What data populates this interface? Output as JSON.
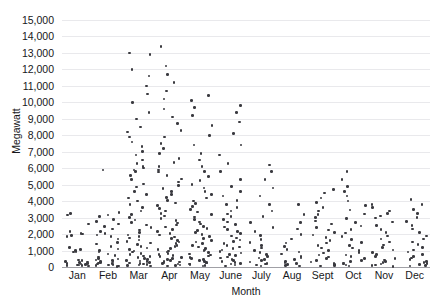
{
  "chart_data": {
    "type": "scatter",
    "title": "",
    "subtitle": "",
    "xlabel": "Month",
    "ylabel": "Megawatt",
    "categories": [
      "Jan",
      "Feb",
      "Mar",
      "Apr",
      "May",
      "June",
      "July",
      "Aug",
      "Sept",
      "Oct",
      "Nov",
      "Dec"
    ],
    "ylim": [
      0,
      15000
    ],
    "ytick_step": 1000,
    "ytick_labels": [
      "0",
      "1,000",
      "2,000",
      "3,000",
      "4,000",
      "5,000",
      "6,000",
      "7,000",
      "8,000",
      "9,000",
      "10,000",
      "11,000",
      "12,000",
      "13,000",
      "14,000",
      "15,000"
    ],
    "ytick_values": [
      0,
      1000,
      2000,
      3000,
      4000,
      5000,
      6000,
      7000,
      8000,
      9000,
      10000,
      11000,
      12000,
      13000,
      14000,
      15000
    ],
    "grid": "horizontal",
    "legend": "none",
    "marker": "dot",
    "marker_color": "#3a3a3f",
    "gridline_color": "#e9e9ec",
    "axis_color": "#a0a0a6",
    "jitter": true,
    "series": [
      {
        "name": "Megawatt",
        "points_by_month": {
          "Jan": [
            60,
            80,
            90,
            110,
            130,
            150,
            170,
            200,
            230,
            260,
            300,
            340,
            380,
            430,
            900,
            950,
            1000,
            1050,
            1200,
            1850,
            1900,
            2000,
            2050,
            2150,
            2600,
            3150,
            3250
          ],
          "Feb": [
            40,
            70,
            100,
            130,
            160,
            190,
            220,
            250,
            280,
            310,
            350,
            390,
            430,
            480,
            520,
            600,
            700,
            800,
            900,
            1000,
            1100,
            1250,
            1400,
            1500,
            1700,
            1850,
            1950,
            2050,
            2150,
            2300,
            2450,
            2600,
            2750,
            2900,
            3050,
            3150,
            3300,
            5900
          ],
          "Mar": [
            50,
            80,
            110,
            140,
            170,
            200,
            240,
            280,
            320,
            360,
            400,
            450,
            500,
            560,
            620,
            680,
            750,
            820,
            900,
            980,
            1050,
            1150,
            1250,
            1350,
            1450,
            1550,
            1650,
            1750,
            1850,
            1950,
            2100,
            2250,
            2400,
            2550,
            2700,
            2850,
            3000,
            3200,
            3400,
            3600,
            3800,
            4000,
            4200,
            4400,
            4600,
            4850,
            5050,
            5300,
            5550,
            5800,
            5900,
            6000,
            6100,
            6300,
            6500,
            6800,
            7000,
            7300,
            7600,
            7900,
            8200,
            8500,
            9000,
            9400,
            10000,
            10500,
            11000,
            11600,
            12000,
            12900,
            13000
          ],
          "Apr": [
            50,
            90,
            130,
            170,
            210,
            250,
            300,
            350,
            400,
            450,
            500,
            560,
            620,
            690,
            760,
            830,
            900,
            980,
            1060,
            1140,
            1230,
            1320,
            1420,
            1520,
            1620,
            1720,
            1830,
            1940,
            2050,
            2170,
            2290,
            2420,
            2550,
            2680,
            2820,
            2960,
            3100,
            3250,
            3400,
            3560,
            3720,
            3880,
            4050,
            4220,
            4400,
            4580,
            4760,
            4950,
            5150,
            5350,
            5550,
            5760,
            5900,
            6100,
            6350,
            6600,
            6900,
            7200,
            7500,
            7900,
            8300,
            8700,
            9100,
            9600,
            10200,
            10700,
            11200,
            11700,
            12200,
            13400
          ],
          "May": [
            60,
            100,
            140,
            190,
            240,
            290,
            340,
            400,
            460,
            520,
            590,
            660,
            730,
            800,
            880,
            960,
            1040,
            1130,
            1220,
            1310,
            1410,
            1510,
            1620,
            1730,
            1840,
            1960,
            2080,
            2200,
            2330,
            2460,
            2600,
            2740,
            2880,
            3030,
            3180,
            3340,
            3500,
            3670,
            3840,
            4020,
            4200,
            4400,
            4600,
            4800,
            5000,
            5250,
            5500,
            5800,
            6100,
            6500,
            6900,
            7400,
            8000,
            8600,
            9200,
            9700,
            10100,
            10400
          ],
          "June": [
            70,
            120,
            170,
            220,
            280,
            340,
            400,
            470,
            540,
            610,
            690,
            770,
            850,
            940,
            1030,
            1120,
            1220,
            1320,
            1430,
            1540,
            1650,
            1770,
            1890,
            2020,
            2150,
            2290,
            2430,
            2580,
            2730,
            2890,
            3050,
            3220,
            3400,
            3600,
            3800,
            4050,
            4300,
            4600,
            4900,
            5300,
            5800,
            6300,
            6800,
            7400,
            8100,
            8800,
            9400,
            9800
          ],
          "July": [
            60,
            110,
            170,
            230,
            300,
            380,
            460,
            550,
            650,
            760,
            880,
            1000,
            1150,
            1300,
            1480,
            1680,
            1900,
            2150,
            2400,
            2700,
            3050,
            3400,
            3800,
            4300,
            4800,
            5300,
            5800,
            6200
          ],
          "Aug": [
            50,
            90,
            140,
            200,
            270,
            350,
            440,
            540,
            650,
            780,
            920,
            1080,
            1250,
            1450,
            1700,
            1980,
            2300,
            2700,
            3200,
            3800
          ],
          "Sept": [
            50,
            100,
            160,
            230,
            310,
            400,
            500,
            610,
            730,
            860,
            1000,
            1150,
            1300,
            1450,
            1600,
            1780,
            1950,
            2100,
            2250,
            2400,
            2600,
            2800,
            3000,
            3200,
            3400,
            3600,
            3900,
            4200,
            4500,
            4700
          ],
          "Oct": [
            60,
            110,
            170,
            240,
            320,
            410,
            510,
            620,
            740,
            870,
            1010,
            1160,
            1320,
            1490,
            1670,
            1860,
            2060,
            2270,
            2490,
            2720,
            2960,
            3210,
            3470,
            3740,
            4020,
            4310,
            4600,
            4900,
            5300,
            5800
          ],
          "Nov": [
            40,
            80,
            130,
            190,
            260,
            340,
            430,
            530,
            640,
            760,
            890,
            1030,
            1180,
            1340,
            1510,
            1690,
            1880,
            2080,
            2290,
            2510,
            2740,
            2980,
            3100,
            3250,
            3400,
            3600,
            3800
          ],
          "Dec": [
            50,
            90,
            140,
            200,
            270,
            350,
            440,
            540,
            650,
            770,
            900,
            1040,
            1190,
            1350,
            1520,
            1700,
            1890,
            2090,
            2300,
            2520,
            2750,
            2990,
            3240,
            3500,
            3800,
            4100
          ]
        }
      }
    ]
  }
}
